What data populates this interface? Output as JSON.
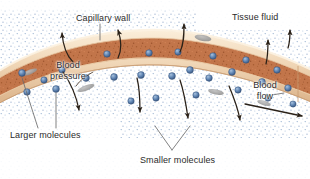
{
  "figure": {
    "width": 310,
    "height": 179,
    "background": "#ffffff"
  },
  "labels": {
    "capillary_wall": "Capillary wall",
    "tissue_fluid": "Tissue fluid",
    "blood_pressure": "Blood pressure",
    "blood_flow": "Blood flow",
    "larger_molecules": "Larger molecules",
    "smaller_molecules": "Smaller molecules"
  },
  "colors": {
    "lumen_fill": "#c2754a",
    "lumen_speckle": "#8c4a26",
    "wall_fill": "#f0d8be",
    "wall_edge": "#d8b48c",
    "wall_highlight": "#fbeeda",
    "nucleus": "#9a9a9a",
    "molecule_fill": "#5a7fae",
    "molecule_edge": "#3c5a82",
    "molecule_highlight": "#9ab6d8",
    "tissue_dot": "#7d9cc4",
    "arrow": "#2a2118",
    "leader_line": "#6b6b6b",
    "text": "#2b2b2b"
  },
  "elements": {
    "vessel": "curved capillary running left to right, arching upward in the middle",
    "molecule_count_in_lumen": 26,
    "nuclei_count": 5,
    "diffusion_arrows_out_top": 4,
    "diffusion_arrows_out_bottom": 4,
    "blood_flow_arrow": "horizontal arrow pointing right out of the vessel"
  }
}
